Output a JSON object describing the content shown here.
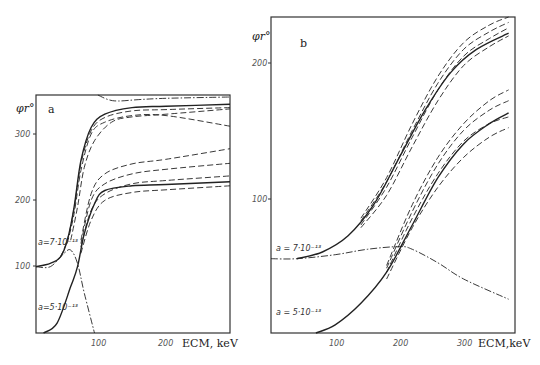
{
  "chart_data": [
    {
      "panel": "a",
      "type": "line",
      "ylabel": "φr°",
      "xlabel": "E_CM, keV",
      "xlim": [
        9,
        294
      ],
      "ylim": [
        0,
        359
      ],
      "xticks": [
        100,
        200
      ],
      "yticks": [
        100,
        200,
        300
      ],
      "annotations": [
        "a=7·10⁻¹³",
        "a=5·10⁻¹³"
      ],
      "series": [
        {
          "name": "a=7e-13 solid",
          "style": "solid",
          "x": [
            9,
            30,
            45,
            55,
            65,
            75,
            90,
            110,
            150,
            200,
            294
          ],
          "y": [
            100,
            105,
            115,
            140,
            190,
            260,
            310,
            330,
            340,
            342,
            345
          ]
        },
        {
          "name": "a=7e-13 dash 1",
          "style": "dash",
          "x": [
            45,
            55,
            65,
            75,
            90,
            110,
            150,
            200,
            294
          ],
          "y": [
            115,
            140,
            188,
            255,
            305,
            325,
            335,
            337,
            340
          ]
        },
        {
          "name": "a=7e-13 dash 2",
          "style": "dash",
          "x": [
            55,
            65,
            75,
            90,
            110,
            150,
            200,
            294
          ],
          "y": [
            135,
            180,
            245,
            300,
            318,
            328,
            328,
            312
          ]
        },
        {
          "name": "a=7e-13 dash 3",
          "style": "dash",
          "x": [
            60,
            70,
            80,
            95,
            120,
            150,
            200,
            294
          ],
          "y": [
            140,
            190,
            250,
            290,
            318,
            326,
            330,
            338
          ]
        },
        {
          "name": "a=7e-13 dashdot",
          "style": "dashdot",
          "x": [
            9,
            30,
            50,
            60,
            70,
            80,
            95
          ],
          "y": [
            100,
            100,
            120,
            125,
            105,
            60,
            0
          ]
        },
        {
          "name": "a=7e-13 top dashdot",
          "style": "dashdot",
          "x": [
            100,
            115,
            130,
            160,
            200,
            294
          ],
          "y": [
            359,
            352,
            350,
            352,
            354,
            356
          ]
        },
        {
          "name": "a=5e-13 solid",
          "style": "solid",
          "x": [
            20,
            40,
            60,
            70,
            80,
            95,
            110,
            150,
            200,
            294
          ],
          "y": [
            0,
            15,
            70,
            100,
            150,
            195,
            215,
            222,
            224,
            228
          ]
        },
        {
          "name": "a=5e-13 dash 1",
          "style": "dash",
          "x": [
            75,
            90,
            110,
            150,
            200,
            294
          ],
          "y": [
            140,
            210,
            240,
            255,
            262,
            278
          ]
        },
        {
          "name": "a=5e-13 dash 2",
          "style": "dash",
          "x": [
            75,
            90,
            110,
            150,
            200,
            294
          ],
          "y": [
            135,
            200,
            225,
            240,
            247,
            256
          ]
        },
        {
          "name": "a=5e-13 dash 3",
          "style": "dash",
          "x": [
            75,
            90,
            110,
            150,
            200,
            294
          ],
          "y": [
            130,
            185,
            210,
            225,
            230,
            237
          ]
        },
        {
          "name": "a=5e-13 dash 4",
          "style": "dash",
          "x": [
            75,
            90,
            110,
            150,
            200,
            294
          ],
          "y": [
            120,
            170,
            200,
            212,
            216,
            222
          ]
        }
      ]
    },
    {
      "panel": "b",
      "type": "line",
      "ylabel": "φr°",
      "xlabel": "E_CM,keV",
      "xlim": [
        0,
        380
      ],
      "ylim": [
        0,
        234
      ],
      "xticks": [
        100,
        200,
        300
      ],
      "yticks": [
        100,
        200
      ],
      "annotations": [
        "a=7·10⁻¹³",
        "a=5·10⁻¹³"
      ],
      "series": [
        {
          "name": "a=7e-13 solid",
          "style": "solid",
          "x": [
            40,
            80,
            120,
            160,
            200,
            240,
            280,
            320,
            370
          ],
          "y": [
            55,
            60,
            72,
            95,
            130,
            165,
            193,
            210,
            222
          ]
        },
        {
          "name": "a=7e-13 dash 1",
          "style": "dash",
          "x": [
            140,
            180,
            220,
            260,
            300,
            340,
            370
          ],
          "y": [
            85,
            115,
            155,
            190,
            215,
            228,
            234
          ]
        },
        {
          "name": "a=7e-13 dash 2",
          "style": "dash",
          "x": [
            140,
            180,
            220,
            260,
            300,
            340,
            370
          ],
          "y": [
            83,
            112,
            150,
            185,
            210,
            223,
            230
          ]
        },
        {
          "name": "a=7e-13 dash 3",
          "style": "dash",
          "x": [
            140,
            180,
            220,
            260,
            300,
            340,
            370
          ],
          "y": [
            80,
            108,
            145,
            180,
            205,
            218,
            226
          ]
        },
        {
          "name": "a=7e-13 dash 4",
          "style": "dash",
          "x": [
            140,
            180,
            220,
            260,
            300,
            340,
            370
          ],
          "y": [
            78,
            102,
            138,
            172,
            198,
            212,
            220
          ]
        },
        {
          "name": "dashdot",
          "style": "dashdot",
          "x": [
            0,
            40,
            100,
            150,
            200,
            220,
            260,
            300,
            370
          ],
          "y": [
            55,
            55,
            58,
            62,
            64,
            62,
            52,
            40,
            25
          ]
        },
        {
          "name": "a=5e-13 solid",
          "style": "solid",
          "x": [
            70,
            100,
            140,
            180,
            220,
            260,
            300,
            340,
            370
          ],
          "y": [
            0,
            6,
            22,
            45,
            80,
            115,
            140,
            155,
            163
          ]
        },
        {
          "name": "a=5e-13 dash 1",
          "style": "dash",
          "x": [
            180,
            220,
            260,
            300,
            340,
            370
          ],
          "y": [
            50,
            95,
            130,
            155,
            172,
            180
          ]
        },
        {
          "name": "a=5e-13 dash 2",
          "style": "dash",
          "x": [
            180,
            220,
            260,
            300,
            340,
            370
          ],
          "y": [
            48,
            90,
            125,
            150,
            165,
            172
          ]
        },
        {
          "name": "a=5e-13 dash 3",
          "style": "dash",
          "x": [
            180,
            220,
            260,
            300,
            340,
            370
          ],
          "y": [
            45,
            85,
            118,
            142,
            155,
            160
          ]
        },
        {
          "name": "a=5e-13 dash 4",
          "style": "dash",
          "x": [
            180,
            220,
            260,
            300,
            340,
            370
          ],
          "y": [
            40,
            78,
            108,
            130,
            145,
            152
          ]
        }
      ]
    }
  ],
  "labels": {
    "panel_a": "a",
    "panel_b": "b",
    "ylabel": "φr°",
    "xlabel_a": "ECM, keV",
    "xlabel_b": "ECM,keV",
    "ann_a_7": "a=7·10⁻¹³",
    "ann_a_5": "a=5·10⁻¹³",
    "ann_b_7": "a = 7·10⁻¹³",
    "ann_b_5": "a = 5·10⁻¹³",
    "a_y300": "300",
    "a_y200": "200",
    "a_y100": "100",
    "a_x100": "100",
    "a_x200": "200",
    "b_y200": "200",
    "b_y100": "100",
    "b_x100": "100",
    "b_x200": "200",
    "b_x300": "300"
  }
}
